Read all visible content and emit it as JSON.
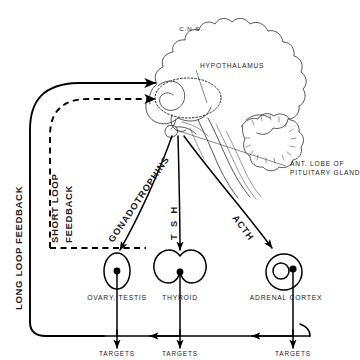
{
  "diagram": {
    "background_color": "#ffffff",
    "ink_color": "#000000",
    "anatomy_line_color": "#3a3a3a"
  },
  "anatomy_labels": {
    "cns": "C.N.S.",
    "hypothalamus": "HYPOTHALAMUS",
    "pituitary_line1": "ANT. LOBE OF",
    "pituitary_line2": "PITUITARY GLAND"
  },
  "feedback_loops": [
    {
      "id": "long-loop",
      "label": "LONG LOOP FEEDBACK",
      "line_style": "solid",
      "orientation": "vertical"
    },
    {
      "id": "short-loop",
      "label_line1": "SHORT LOOP",
      "label_line2": "FEEDBACK",
      "line_style": "dashed",
      "orientation": "vertical"
    }
  ],
  "hormones": [
    {
      "id": "gonadotrophins",
      "label": "GONADOTROPHINS",
      "target_gland": "ovary-testis"
    },
    {
      "id": "tsh",
      "label": "T S H",
      "target_gland": "thyroid"
    },
    {
      "id": "acth",
      "label": "ACTH",
      "target_gland": "adrenal-cortex"
    }
  ],
  "glands": [
    {
      "id": "ovary-testis",
      "label": "OVARY, TESTIS",
      "shape": "ellipse-with-dot"
    },
    {
      "id": "thyroid",
      "label": "THYROID",
      "shape": "bilobed-with-dot"
    },
    {
      "id": "adrenal-cortex",
      "label": "ADRENAL CORTEX",
      "shape": "circle-in-circle-with-dot"
    }
  ],
  "targets": [
    {
      "id": "targets-gonadal",
      "label": "TARGETS"
    },
    {
      "id": "targets-thyroid",
      "label": "TARGETS"
    },
    {
      "id": "targets-adrenal",
      "label": "TARGETS"
    }
  ]
}
